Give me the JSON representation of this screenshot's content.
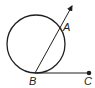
{
  "diagram": {
    "type": "geometry",
    "points": {
      "A": {
        "label": "A"
      },
      "B": {
        "label": "B"
      },
      "C": {
        "label": "C"
      }
    },
    "colors": {
      "stroke": "#231f20",
      "background": "#ffffff"
    }
  }
}
